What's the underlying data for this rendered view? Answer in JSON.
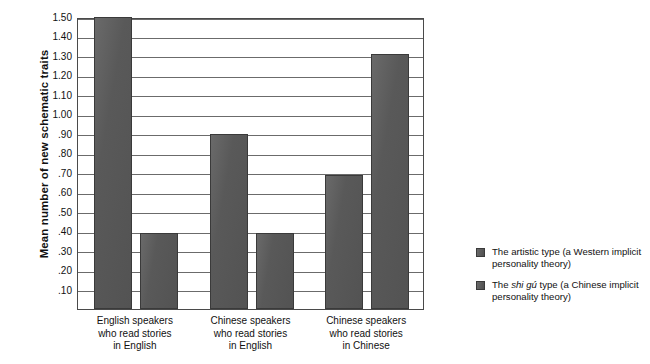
{
  "chart_data": {
    "type": "bar",
    "title": "",
    "xlabel": "",
    "ylabel": "Mean number of new schematic traits",
    "ylim": [
      0,
      1.5
    ],
    "grid": true,
    "legend_position": "right",
    "categories": [
      "English speakers\nwho read stories\nin English",
      "Chinese speakers\nwho read stories\nin English",
      "Chinese speakers\nwho read stories\nin Chinese"
    ],
    "category_lines": [
      [
        "English speakers",
        "who read stories",
        "in English"
      ],
      [
        "Chinese speakers",
        "who read stories",
        "in English"
      ],
      [
        "Chinese speakers",
        "who read stories",
        "in Chinese"
      ]
    ],
    "ytick_labels": [
      ".10",
      ".20",
      ".30",
      ".40",
      ".50",
      ".60",
      ".70",
      ".80",
      ".90",
      "1.00",
      "1.10",
      "1.20",
      "1.30",
      "1.40",
      "1.50"
    ],
    "ytick_values": [
      0.1,
      0.2,
      0.3,
      0.4,
      0.5,
      0.6,
      0.7,
      0.8,
      0.9,
      1.0,
      1.1,
      1.2,
      1.3,
      1.4,
      1.5
    ],
    "series": [
      {
        "name": "The artistic type (a Western implicit personality theory)",
        "values": [
          1.5,
          0.9,
          0.69
        ],
        "color": "#595959"
      },
      {
        "name": "The shi gu type (a Chinese implicit personality theory)",
        "values": [
          0.39,
          0.39,
          1.31
        ],
        "color": "#595959"
      }
    ]
  },
  "legend": {
    "items": [
      {
        "prefix": "The artistic type (a Western implicit",
        "italic": "",
        "suffix": "",
        "line2": "personality theory)"
      },
      {
        "prefix": "The ",
        "italic": "shi gú",
        "suffix": " type (a Chinese implicit",
        "line2": "personality theory)"
      }
    ]
  },
  "axis": {
    "y_title": "Mean number of new schematic traits"
  }
}
